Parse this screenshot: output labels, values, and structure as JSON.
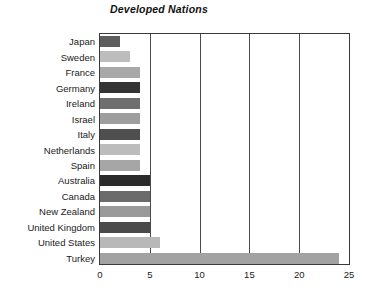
{
  "chart_data": {
    "type": "bar",
    "orientation": "horizontal",
    "title": "Developed Nations",
    "xlabel": "",
    "ylabel": "",
    "xlim": [
      0,
      25
    ],
    "xticks": [
      0,
      5,
      10,
      15,
      20,
      25
    ],
    "xtick_labels": [
      "0",
      "5",
      "10",
      "15",
      "20",
      "25"
    ],
    "grid": "vertical",
    "legend": "none",
    "categories": [
      "Japan",
      "Sweden",
      "France",
      "Germany",
      "Ireland",
      "Israel",
      "Italy",
      "Netherlands",
      "Spain",
      "Australia",
      "Canada",
      "New Zealand",
      "United Kingdom",
      "United States",
      "Turkey"
    ],
    "values": [
      2,
      3,
      4,
      4,
      4,
      4,
      4,
      4,
      4,
      5,
      5,
      5,
      5,
      6,
      24
    ],
    "bar_colors": [
      "#5e5e5e",
      "#bdbdbd",
      "#a8a8a8",
      "#343434",
      "#6f6f6f",
      "#9e9e9e",
      "#4f4f4f",
      "#bcbcbc",
      "#a6a6a6",
      "#2b2b2b",
      "#6b6b6b",
      "#9a9a9a",
      "#4a4a4a",
      "#b8b8b8",
      "#a2a2a2"
    ]
  },
  "axis": {
    "border_color": "#3a3a3a",
    "gridline_color": "#4a4a4a"
  }
}
